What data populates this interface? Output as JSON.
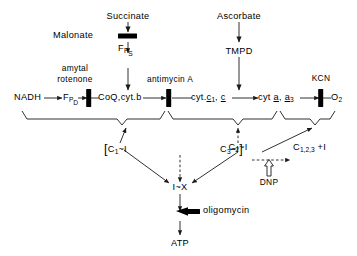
{
  "diagram": {
    "line_color": "#1a1a1a",
    "inhibitor_color": "#000000",
    "substrates": {
      "succinate": "Succinate",
      "ascorbate": "Ascorbate",
      "tmpd": "TMPD",
      "nadh": "NADH",
      "oxygen_symbol": "O",
      "oxygen_sub": "2",
      "atp": "ATP"
    },
    "carriers": {
      "fp_d_main": "F",
      "fp_d_p": "P",
      "fp_d_sub": "D",
      "fp_s_main": "F",
      "fp_s_p": "P",
      "fp_s_sub": "S",
      "coq_cytb": "CoQ,cyt.b",
      "cyt_c1_c_prefix": "cyt.",
      "cyt_c1_c_c1": "c",
      "cyt_c1_c_sub1": "1",
      "cyt_c1_c_c2": "c",
      "cyt_a_a3_prefix": "cyt ",
      "cyt_a_a3_a": "a",
      "cyt_a_a3_a3": "a",
      "cyt_a_a3_sub3": "3"
    },
    "inhibitors": [
      {
        "id": "malonate",
        "label": "Malonate",
        "orientation": "horizontal"
      },
      {
        "id": "amytal-rotenone",
        "label_line1": "amytal",
        "label_line2": "rotenone",
        "orientation": "vertical"
      },
      {
        "id": "antimycin-a",
        "label": "antimycin A",
        "orientation": "vertical"
      },
      {
        "id": "kcn",
        "label": "KCN",
        "orientation": "vertical"
      },
      {
        "id": "oligomycin",
        "label": "oligomycin",
        "orientation": "horizontal"
      }
    ],
    "uncoupler": {
      "label": "DNP"
    },
    "coupling_sites": {
      "site1_open_bracket": "[",
      "site1": "C",
      "site1_sub": "1",
      "site1_tilde_i": "~I",
      "site2": "C",
      "site2_sub": "2",
      "site2_tilde_i": "~I",
      "site3": "C",
      "site3_sub": "3",
      "site3_tilde_i": "~I",
      "site3_close_bracket": "]",
      "released": "C",
      "released_sub": "1,2,3",
      "released_plus_i": "+I",
      "intermediate": "I~X"
    }
  }
}
